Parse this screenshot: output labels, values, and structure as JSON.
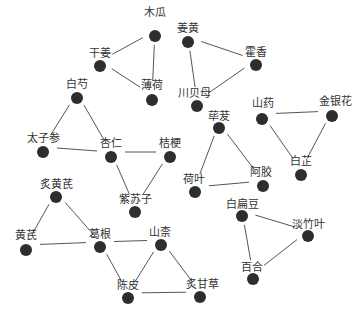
{
  "diagram": {
    "type": "herb-compatibility-network",
    "colors": {
      "node": "#2e2e2e",
      "edge": "#555555",
      "label": "#333333",
      "background": "#ffffff"
    },
    "nodes": [
      {
        "id": "mugua",
        "label": "木瓜"
      },
      {
        "id": "ganjiang",
        "label": "干姜"
      },
      {
        "id": "bohe",
        "label": "薄荷"
      },
      {
        "id": "jianghuang",
        "label": "姜黄"
      },
      {
        "id": "huoxiang",
        "label": "霍香"
      },
      {
        "id": "chuanbeimu",
        "label": "川贝母"
      },
      {
        "id": "baishao",
        "label": "白芍"
      },
      {
        "id": "taizishen",
        "label": "太子参"
      },
      {
        "id": "xingren",
        "label": "杏仁"
      },
      {
        "id": "jiegeng",
        "label": "桔梗"
      },
      {
        "id": "zisuzi",
        "label": "紫苏子"
      },
      {
        "id": "bibo",
        "label": "荜茇"
      },
      {
        "id": "heye",
        "label": "荷叶"
      },
      {
        "id": "ejiao",
        "label": "阿胶"
      },
      {
        "id": "shanyao",
        "label": "山药"
      },
      {
        "id": "jinyinhua",
        "label": "金银花"
      },
      {
        "id": "baizhi",
        "label": "白芷"
      },
      {
        "id": "zhihuangqi",
        "label": "炙黄芪"
      },
      {
        "id": "huangqi",
        "label": "黄芪"
      },
      {
        "id": "gegen",
        "label": "葛根"
      },
      {
        "id": "shannai",
        "label": "山柰"
      },
      {
        "id": "chenpi",
        "label": "陈皮"
      },
      {
        "id": "zhigancao",
        "label": "炙甘草"
      },
      {
        "id": "baibiandou",
        "label": "白扁豆"
      },
      {
        "id": "danzhuye",
        "label": "淡竹叶"
      },
      {
        "id": "baihe",
        "label": "百合"
      }
    ],
    "edges": [
      [
        "ganjiang",
        "mugua"
      ],
      [
        "ganjiang",
        "bohe"
      ],
      [
        "mugua",
        "bohe"
      ],
      [
        "jianghuang",
        "huoxiang"
      ],
      [
        "jianghuang",
        "chuanbeimu"
      ],
      [
        "chuanbeimu",
        "huoxiang"
      ],
      [
        "baishao",
        "taizishen"
      ],
      [
        "baishao",
        "xingren"
      ],
      [
        "taizishen",
        "xingren"
      ],
      [
        "xingren",
        "jiegeng"
      ],
      [
        "xingren",
        "zisuzi"
      ],
      [
        "jiegeng",
        "zisuzi"
      ],
      [
        "bibo",
        "heye"
      ],
      [
        "bibo",
        "ejiao"
      ],
      [
        "heye",
        "ejiao"
      ],
      [
        "shanyao",
        "jinyinhua"
      ],
      [
        "shanyao",
        "baizhi"
      ],
      [
        "jinyinhua",
        "baizhi"
      ],
      [
        "zhihuangqi",
        "huangqi"
      ],
      [
        "zhihuangqi",
        "gegen"
      ],
      [
        "huangqi",
        "gegen"
      ],
      [
        "gegen",
        "shannai"
      ],
      [
        "gegen",
        "chenpi"
      ],
      [
        "shannai",
        "chenpi"
      ],
      [
        "shannai",
        "zhigancao"
      ],
      [
        "chenpi",
        "zhigancao"
      ],
      [
        "baibiandou",
        "danzhuye"
      ],
      [
        "baibiandou",
        "baihe"
      ],
      [
        "baihe",
        "danzhuye"
      ]
    ]
  }
}
